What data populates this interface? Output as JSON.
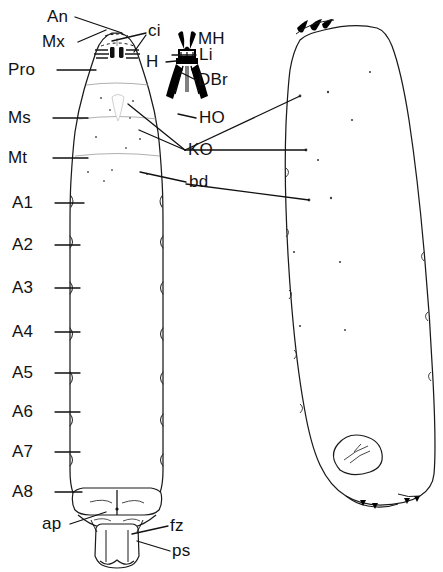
{
  "figure": {
    "views": [
      {
        "name": "ventral-view",
        "position": "left"
      },
      {
        "name": "lateral-view",
        "position": "right"
      }
    ],
    "ink_color": "#111111",
    "background_color": "#ffffff"
  },
  "labels": {
    "an": "An",
    "mx": "Mx",
    "ci": "ci",
    "pro": "Pro",
    "mh": "MH",
    "h": "H",
    "li": "Li",
    "dbr": "DBr",
    "ms": "Ms",
    "ho": "HO",
    "ko": "KO",
    "mt": "Mt",
    "bd": "bd",
    "a1": "A1",
    "a2": "A2",
    "a3": "A3",
    "a4": "A4",
    "a5": "A5",
    "a6": "A6",
    "a7": "A7",
    "a8": "A8",
    "ap": "ap",
    "fz": "fz",
    "ps": "ps"
  }
}
